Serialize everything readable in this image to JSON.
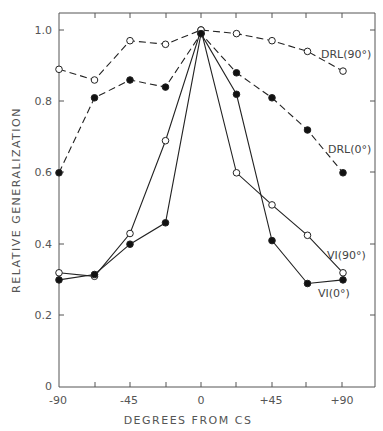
{
  "chart_data": {
    "type": "line",
    "title": "",
    "xlabel": "DEGREES FROM CS",
    "ylabel": "RELATIVE GENERALIZATION",
    "x": [
      -90,
      -67.5,
      -45,
      -22.5,
      0,
      22.5,
      45,
      67.5,
      90
    ],
    "xticks": [
      -90,
      -67.5,
      -45,
      -22.5,
      0,
      22.5,
      45,
      67.5,
      90
    ],
    "xtick_labels": [
      "-90",
      "",
      "-45",
      "",
      "0",
      "",
      "+45",
      "",
      "+90"
    ],
    "yticks": [
      0,
      0.2,
      0.4,
      0.6,
      0.8,
      1.0
    ],
    "ytick_labels": [
      "0",
      "0.2",
      "0.4",
      "0.6",
      "0.8",
      "1.0"
    ],
    "xlim": [
      -90,
      110
    ],
    "ylim": [
      0,
      1.05
    ],
    "grid": false,
    "legend": "inline labels at right",
    "series": [
      {
        "name": "DRL(90°)",
        "marker": "open-circle",
        "line": "dashed",
        "values": [
          0.89,
          0.86,
          0.97,
          0.96,
          1.0,
          0.99,
          0.97,
          0.94,
          0.885
        ]
      },
      {
        "name": "DRL(0°)",
        "marker": "filled-circle",
        "line": "dashed",
        "values": [
          0.6,
          0.81,
          0.86,
          0.84,
          0.99,
          0.88,
          0.81,
          0.72,
          0.6
        ]
      },
      {
        "name": "VI(90°)",
        "marker": "open-circle",
        "line": "solid",
        "values": [
          0.32,
          0.31,
          0.43,
          0.69,
          1.0,
          0.6,
          0.51,
          0.425,
          0.32
        ]
      },
      {
        "name": "VI(0°)",
        "marker": "filled-circle",
        "line": "solid",
        "values": [
          0.3,
          0.315,
          0.4,
          0.46,
          0.99,
          0.82,
          0.41,
          0.29,
          0.3
        ]
      }
    ]
  },
  "labels": {
    "xlabel": "DEGREES FROM CS",
    "ylabel": "RELATIVE GENERALIZATION",
    "drl90": "DRL(90°)",
    "drl0": "DRL(0°)",
    "vi90": "VI(90°)",
    "vi0": "VI(0°)",
    "y0": "0",
    "y02": "0.2",
    "y04": "0.4",
    "y06": "0.6",
    "y08": "0.8",
    "y10": "1.0",
    "xm90": "-90",
    "xm45": "-45",
    "x0": "0",
    "xp45": "+45",
    "xp90": "+90"
  }
}
